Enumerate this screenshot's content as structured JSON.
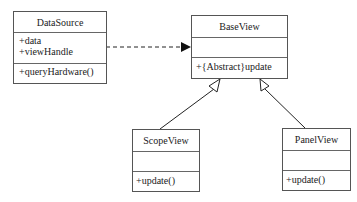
{
  "diagram": {
    "type": "uml-class-diagram",
    "classes": [
      {
        "id": "datasource",
        "name": "DataSource",
        "attributes": [
          "+data",
          "+viewHandle"
        ],
        "operations": [
          "+queryHardware()"
        ]
      },
      {
        "id": "baseview",
        "name": "BaseView",
        "attributes": [],
        "operations": [
          "+{Abstract}update"
        ]
      },
      {
        "id": "scopeview",
        "name": "ScopeView",
        "attributes": [],
        "operations": [
          "+update()"
        ]
      },
      {
        "id": "panelview",
        "name": "PanelView",
        "attributes": [],
        "operations": [
          "+update()"
        ]
      }
    ],
    "relationships": [
      {
        "type": "dependency",
        "style": "dashed",
        "from": "DataSource",
        "to": "BaseView"
      },
      {
        "type": "generalization",
        "from": "ScopeView",
        "to": "BaseView"
      },
      {
        "type": "generalization",
        "from": "PanelView",
        "to": "BaseView"
      }
    ]
  }
}
